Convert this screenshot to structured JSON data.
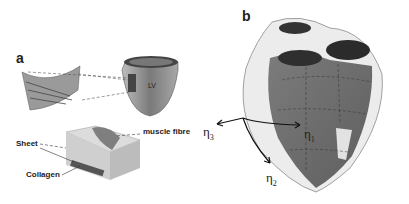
{
  "figure": {
    "panel_a": {
      "label": "a",
      "ventricle_label": "LV",
      "callouts": {
        "muscle_fibre": "muscle fibre",
        "sheet": "Sheet",
        "collagen": "Collagen"
      }
    },
    "panel_b": {
      "label": "b",
      "axes": {
        "eta1": {
          "symbol": "η",
          "sub": "1"
        },
        "eta2": {
          "symbol": "η",
          "sub": "2"
        },
        "eta3": {
          "symbol": "η",
          "sub": "3"
        }
      }
    },
    "colors": {
      "heart_surface": "#6e6e6e",
      "mesh": "#e8e8e8",
      "dark": "#2a2a2a"
    }
  }
}
